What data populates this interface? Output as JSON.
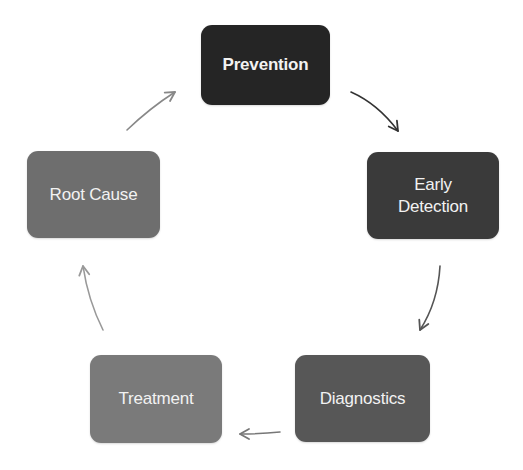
{
  "diagram": {
    "type": "cycle",
    "nodes": [
      {
        "id": "prevention",
        "label": "Prevention",
        "color": "#252525",
        "x": 201,
        "y": 25,
        "w": 129,
        "h": 80,
        "bold": true
      },
      {
        "id": "early-detection",
        "label": "Early\nDetection",
        "color": "#3a3a3a",
        "x": 367,
        "y": 152,
        "w": 132,
        "h": 87,
        "bold": false
      },
      {
        "id": "diagnostics",
        "label": "Diagnostics",
        "color": "#575757",
        "x": 295,
        "y": 355,
        "w": 135,
        "h": 87,
        "bold": false
      },
      {
        "id": "treatment",
        "label": "Treatment",
        "color": "#7a7a7a",
        "x": 90,
        "y": 355,
        "w": 132,
        "h": 88,
        "bold": false
      },
      {
        "id": "root-cause",
        "label": "Root Cause",
        "color": "#6e6e6e",
        "x": 27,
        "y": 151,
        "w": 133,
        "h": 87,
        "bold": false
      }
    ],
    "edges": [
      {
        "from": "prevention",
        "to": "early-detection",
        "color": "#333333",
        "path": "M351 92 Q378 104 398 131",
        "head": [
          398,
          131
        ],
        "angle": 55
      },
      {
        "from": "early-detection",
        "to": "diagnostics",
        "color": "#555555",
        "path": "M440 266 Q438 302 420 330",
        "head": [
          420,
          330
        ],
        "angle": 115
      },
      {
        "from": "diagnostics",
        "to": "treatment",
        "color": "#777777",
        "path": "M280 432 Q262 434 240 434",
        "head": [
          240,
          434
        ],
        "angle": 180
      },
      {
        "from": "treatment",
        "to": "root-cause",
        "color": "#999999",
        "path": "M103 330 Q88 300 83 266",
        "head": [
          83,
          266
        ],
        "angle": 262
      },
      {
        "from": "root-cause",
        "to": "prevention",
        "color": "#888888",
        "path": "M127 130 Q150 108 175 92",
        "head": [
          175,
          92
        ],
        "angle": -32
      }
    ]
  }
}
